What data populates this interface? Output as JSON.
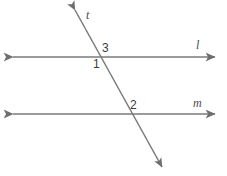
{
  "figure": {
    "type": "geometry-diagram",
    "width": 227,
    "height": 176,
    "background_color": "#ffffff",
    "stroke_color": "#7a7a7a",
    "label_color": "#3c3c3c",
    "lines": [
      {
        "id": "line-l",
        "name": "l",
        "label": "l",
        "orientation": "horizontal",
        "x1": 13,
        "y1": 57,
        "x2": 215,
        "y2": 57,
        "arrows": "both",
        "label_x": 196,
        "label_y": 39
      },
      {
        "id": "line-m",
        "name": "m",
        "label": "m",
        "orientation": "horizontal",
        "x1": 13,
        "y1": 114,
        "x2": 215,
        "y2": 114,
        "arrows": "both",
        "label_x": 193,
        "label_y": 97
      },
      {
        "id": "line-t",
        "name": "t",
        "label": "t",
        "orientation": "transversal",
        "x1": 75,
        "y1": 10,
        "x2": 162,
        "y2": 167,
        "arrows": "both",
        "label_x": 86,
        "label_y": 9
      }
    ],
    "angle_labels": [
      {
        "id": "angle-3",
        "label": "3",
        "x": 102,
        "y": 42,
        "at_intersection": "line-l",
        "position": "above-right"
      },
      {
        "id": "angle-1",
        "label": "1",
        "x": 93,
        "y": 58,
        "at_intersection": "line-l",
        "position": "below-left"
      },
      {
        "id": "angle-2",
        "label": "2",
        "x": 130,
        "y": 99,
        "at_intersection": "line-m",
        "position": "above-right"
      }
    ],
    "intersections": [
      {
        "id": "intersection-t-l",
        "x": 103,
        "y": 57,
        "lines": [
          "t",
          "l"
        ]
      },
      {
        "id": "intersection-t-m",
        "x": 129,
        "y": 114,
        "lines": [
          "t",
          "m"
        ]
      }
    ]
  }
}
